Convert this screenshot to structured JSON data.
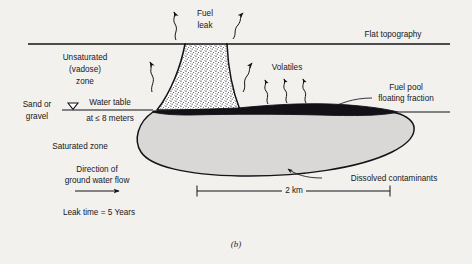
{
  "figure": {
    "caption": "(b)",
    "background_color": "#f2f1ee",
    "ink_color": "#141317"
  },
  "labels": {
    "fuel_leak_line1": "Fuel",
    "fuel_leak_line2": "leak",
    "flat_topography": "Flat topography",
    "unsaturated_line1": "Unsaturated",
    "unsaturated_line2": "(vadose)",
    "unsaturated_line3": "zone",
    "volatiles": "Volatiles",
    "fuel_pool_line1": "Fuel pool",
    "fuel_pool_line2": "floating fraction",
    "sand_line1": "Sand or",
    "sand_line2": "gravel",
    "water_table_line1": "Water table",
    "water_table_line2": "at ≤ 8 meters",
    "saturated_zone": "Saturated zone",
    "flow_line1": "Direction of",
    "flow_line2": "ground water flow",
    "leak_time": "Leak time = 5 Years",
    "dissolved_contaminants": "Dissolved contaminants",
    "scale_bar": "2 km"
  },
  "icons": {
    "water_table_symbol": "water-table-triangle-icon",
    "flow_arrow": "flow-arrow-icon",
    "volatile_arrow": "squiggly-vapor-arrow-icon",
    "leak_vapor_arrow": "squiggly-vapor-arrow-icon",
    "scale_bar_icon": "scale-bar-icon",
    "leader_line": "leader-line-icon"
  },
  "colors": {
    "ground_surface": "#141317",
    "vadose_plume_fill": "#ffffff",
    "vadose_plume_stipple": "#2b2a2e",
    "fuel_pool_fill": "#121115",
    "dissolved_plume_fill": "#d9d8d6",
    "dissolved_plume_stroke": "#141317",
    "text": "#18161a"
  },
  "geometry": {
    "ground_surface_y": 44,
    "water_table_y": 110,
    "scale_bar_value_km": 2,
    "water_table_depth_m": 8,
    "leak_time_years": 5
  }
}
